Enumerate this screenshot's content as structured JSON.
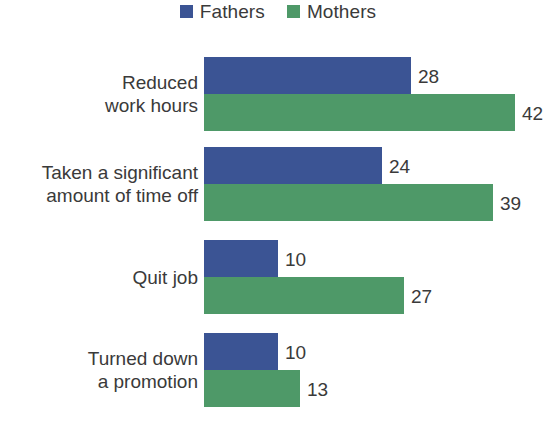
{
  "legend": {
    "entries": [
      {
        "label": "Fathers",
        "color": "#3b5494",
        "icon": "square-swatch-icon"
      },
      {
        "label": "Mothers",
        "color": "#4e9968",
        "icon": "square-swatch-icon"
      }
    ]
  },
  "chart_data": {
    "type": "bar",
    "orientation": "horizontal",
    "title": "",
    "subtitle": "",
    "xlabel": "",
    "ylabel": "",
    "grid": false,
    "legend_position": "top-center",
    "axis_visible": false,
    "tick_labels_visible": false,
    "data_labels": true,
    "xlim": [
      0,
      42
    ],
    "categories": [
      "Reduced\nwork hours",
      "Taken a significant\namount of time off",
      "Quit job",
      "Turned down\na promotion"
    ],
    "series": [
      {
        "name": "Fathers",
        "color": "#3b5494",
        "values": [
          28,
          24,
          10,
          10
        ]
      },
      {
        "name": "Mothers",
        "color": "#4e9968",
        "values": [
          42,
          39,
          27,
          13
        ]
      }
    ],
    "value_labels": {
      "Fathers": [
        "28",
        "24",
        "10",
        "10"
      ],
      "Mothers": [
        "42",
        "39",
        "27",
        "13"
      ]
    }
  },
  "groups": [
    {
      "label": "Reduced\nwork hours",
      "fathers_value": 28,
      "mothers_value": 42,
      "fathers_label": "28",
      "mothers_label": "42"
    },
    {
      "label": "Taken a significant\namount of time off",
      "fathers_value": 24,
      "mothers_value": 39,
      "fathers_label": "24",
      "mothers_label": "39"
    },
    {
      "label": "Quit job",
      "fathers_value": 10,
      "mothers_value": 27,
      "fathers_label": "10",
      "mothers_label": "27"
    },
    {
      "label": "Turned down\na promotion",
      "fathers_value": 10,
      "mothers_value": 13,
      "fathers_label": "10",
      "mothers_label": "13"
    }
  ],
  "layout": {
    "bar_origin_x": 204,
    "px_per_unit": 7.4,
    "bar_height": 37,
    "group_tops": [
      57,
      147,
      240,
      333
    ]
  }
}
